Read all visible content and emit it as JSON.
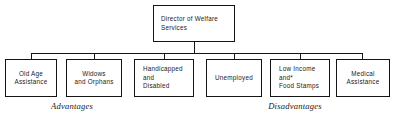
{
  "diagram": {
    "type": "organizational-chart",
    "background_color": "#ffffff",
    "ink_color": "#141414",
    "root": {
      "label": "Director of Welfare\nServices"
    },
    "nodes": [
      {
        "label": "Old Age\nAssistance"
      },
      {
        "label": "Widows\nand Orphans"
      },
      {
        "label": "Handicapped\nand\nDisabled"
      },
      {
        "label": "Unemployed"
      },
      {
        "label": "Low Income\nand*\nFood Stamps"
      },
      {
        "label": "Medical\nAssistance"
      }
    ],
    "captions": {
      "left": "Advantages",
      "right": "Disadvantages"
    }
  }
}
